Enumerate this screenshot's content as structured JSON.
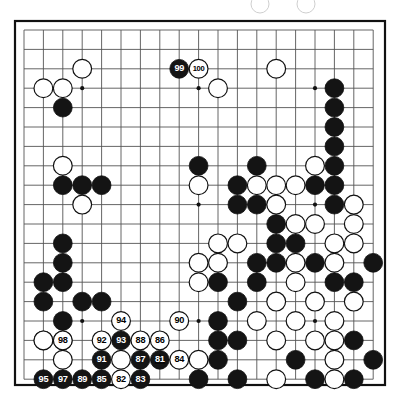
{
  "diagram": {
    "kind": "go-board-diagram",
    "board_size": 19,
    "visible_columns": 19,
    "visible_rows": 19,
    "colors": {
      "black_stone": "#141414",
      "white_stone": "#ffffff",
      "stone_outline": "#111111",
      "grid_line": "#555555",
      "border_line": "#111111",
      "background": "#ffffff",
      "label_on_black": "#ffffff",
      "label_on_white": "#000000"
    },
    "geometry": {
      "origin_x": 24,
      "origin_y": 30,
      "step": 19.4,
      "stone_radius": 9.4,
      "border_x": 15,
      "border_y": 21,
      "border_w": 370,
      "border_h": 364
    },
    "star_points": [
      {
        "col": 3,
        "row": 3
      },
      {
        "col": 9,
        "row": 3
      },
      {
        "col": 15,
        "row": 3
      },
      {
        "col": 3,
        "row": 9
      },
      {
        "col": 9,
        "row": 9
      },
      {
        "col": 15,
        "row": 9
      },
      {
        "col": 3,
        "row": 15
      },
      {
        "col": 9,
        "row": 15
      },
      {
        "col": 15,
        "row": 15
      }
    ],
    "ghost_circles": [
      {
        "cx": 260,
        "cy": 4,
        "r": 9
      },
      {
        "cx": 306,
        "cy": 4,
        "r": 9
      }
    ],
    "triangle_marks": [
      {
        "col": 7,
        "row": 17
      }
    ],
    "stones": [
      {
        "col": 3,
        "row": 2,
        "color": "white",
        "label": ""
      },
      {
        "col": 1,
        "row": 3,
        "color": "white",
        "label": ""
      },
      {
        "col": 2,
        "row": 3,
        "color": "white",
        "label": ""
      },
      {
        "col": 2,
        "row": 4,
        "color": "black",
        "label": ""
      },
      {
        "col": 2,
        "row": 7,
        "color": "white",
        "label": ""
      },
      {
        "col": 3,
        "row": 9,
        "color": "white",
        "label": ""
      },
      {
        "col": 2,
        "row": 8,
        "color": "black",
        "label": ""
      },
      {
        "col": 3,
        "row": 8,
        "color": "black",
        "label": ""
      },
      {
        "col": 4,
        "row": 8,
        "color": "black",
        "label": ""
      },
      {
        "col": 8,
        "row": 2,
        "color": "black",
        "label": "99"
      },
      {
        "col": 9,
        "row": 2,
        "color": "white",
        "label": "100"
      },
      {
        "col": 10,
        "row": 3,
        "color": "white",
        "label": ""
      },
      {
        "col": 13,
        "row": 2,
        "color": "white",
        "label": ""
      },
      {
        "col": 16,
        "row": 3,
        "color": "black",
        "label": ""
      },
      {
        "col": 16,
        "row": 4,
        "color": "black",
        "label": ""
      },
      {
        "col": 16,
        "row": 5,
        "color": "black",
        "label": ""
      },
      {
        "col": 16,
        "row": 6,
        "color": "black",
        "label": ""
      },
      {
        "col": 15,
        "row": 7,
        "color": "white",
        "label": ""
      },
      {
        "col": 16,
        "row": 7,
        "color": "black",
        "label": ""
      },
      {
        "col": 12,
        "row": 7,
        "color": "black",
        "label": ""
      },
      {
        "col": 11,
        "row": 8,
        "color": "black",
        "label": ""
      },
      {
        "col": 12,
        "row": 8,
        "color": "white",
        "label": ""
      },
      {
        "col": 13,
        "row": 8,
        "color": "white",
        "label": ""
      },
      {
        "col": 14,
        "row": 8,
        "color": "white",
        "label": ""
      },
      {
        "col": 15,
        "row": 8,
        "color": "black",
        "label": ""
      },
      {
        "col": 16,
        "row": 8,
        "color": "black",
        "label": ""
      },
      {
        "col": 11,
        "row": 9,
        "color": "black",
        "label": ""
      },
      {
        "col": 12,
        "row": 9,
        "color": "black",
        "label": ""
      },
      {
        "col": 13,
        "row": 9,
        "color": "white",
        "label": ""
      },
      {
        "col": 16,
        "row": 9,
        "color": "black",
        "label": ""
      },
      {
        "col": 17,
        "row": 9,
        "color": "white",
        "label": ""
      },
      {
        "col": 9,
        "row": 7,
        "color": "black",
        "label": ""
      },
      {
        "col": 9,
        "row": 8,
        "color": "white",
        "label": ""
      },
      {
        "col": 13,
        "row": 10,
        "color": "black",
        "label": ""
      },
      {
        "col": 14,
        "row": 10,
        "color": "white",
        "label": ""
      },
      {
        "col": 15,
        "row": 10,
        "color": "white",
        "label": ""
      },
      {
        "col": 17,
        "row": 10,
        "color": "white",
        "label": ""
      },
      {
        "col": 10,
        "row": 11,
        "color": "white",
        "label": ""
      },
      {
        "col": 11,
        "row": 11,
        "color": "white",
        "label": ""
      },
      {
        "col": 13,
        "row": 11,
        "color": "black",
        "label": ""
      },
      {
        "col": 14,
        "row": 11,
        "color": "black",
        "label": ""
      },
      {
        "col": 16,
        "row": 11,
        "color": "white",
        "label": ""
      },
      {
        "col": 17,
        "row": 11,
        "color": "white",
        "label": ""
      },
      {
        "col": 2,
        "row": 11,
        "color": "black",
        "label": ""
      },
      {
        "col": 2,
        "row": 12,
        "color": "black",
        "label": ""
      },
      {
        "col": 9,
        "row": 12,
        "color": "white",
        "label": ""
      },
      {
        "col": 10,
        "row": 12,
        "color": "white",
        "label": ""
      },
      {
        "col": 12,
        "row": 12,
        "color": "black",
        "label": ""
      },
      {
        "col": 13,
        "row": 12,
        "color": "black",
        "label": ""
      },
      {
        "col": 15,
        "row": 12,
        "color": "black",
        "label": ""
      },
      {
        "col": 16,
        "row": 12,
        "color": "white",
        "label": ""
      },
      {
        "col": 18,
        "row": 12,
        "color": "black",
        "label": ""
      },
      {
        "col": 1,
        "row": 13,
        "color": "black",
        "label": ""
      },
      {
        "col": 2,
        "row": 13,
        "color": "black",
        "label": ""
      },
      {
        "col": 9,
        "row": 13,
        "color": "white",
        "label": ""
      },
      {
        "col": 10,
        "row": 13,
        "color": "black",
        "label": ""
      },
      {
        "col": 12,
        "row": 13,
        "color": "black",
        "label": ""
      },
      {
        "col": 14,
        "row": 13,
        "color": "white",
        "label": ""
      },
      {
        "col": 16,
        "row": 13,
        "color": "black",
        "label": ""
      },
      {
        "col": 17,
        "row": 13,
        "color": "black",
        "label": ""
      },
      {
        "col": 1,
        "row": 14,
        "color": "black",
        "label": ""
      },
      {
        "col": 3,
        "row": 14,
        "color": "black",
        "label": ""
      },
      {
        "col": 4,
        "row": 14,
        "color": "black",
        "label": ""
      },
      {
        "col": 2,
        "row": 15,
        "color": "black",
        "label": ""
      },
      {
        "col": 1,
        "row": 16,
        "color": "black",
        "label": ""
      },
      {
        "col": 2,
        "row": 16,
        "color": "black",
        "label": ""
      },
      {
        "col": 5,
        "row": 15,
        "color": "white",
        "label": "94"
      },
      {
        "col": 8,
        "row": 15,
        "color": "white",
        "label": "90"
      },
      {
        "col": 1,
        "row": 16,
        "color": "white",
        "label": ""
      },
      {
        "col": 2,
        "row": 16,
        "color": "white",
        "label": "98"
      },
      {
        "col": 4,
        "row": 16,
        "color": "white",
        "label": "92"
      },
      {
        "col": 5,
        "row": 16,
        "color": "black",
        "label": "93"
      },
      {
        "col": 6,
        "row": 16,
        "color": "white",
        "label": "88"
      },
      {
        "col": 7,
        "row": 16,
        "color": "white",
        "label": "86"
      },
      {
        "col": 2,
        "row": 17,
        "color": "white",
        "label": ""
      },
      {
        "col": 4,
        "row": 17,
        "color": "black",
        "label": "91"
      },
      {
        "col": 5,
        "row": 17,
        "color": "white",
        "label": ""
      },
      {
        "col": 6,
        "row": 17,
        "color": "black",
        "label": "87"
      },
      {
        "col": 7,
        "row": 17,
        "color": "black",
        "label": "81"
      },
      {
        "col": 8,
        "row": 17,
        "color": "white",
        "label": "84"
      },
      {
        "col": 1,
        "row": 18,
        "color": "black",
        "label": "95"
      },
      {
        "col": 2,
        "row": 18,
        "color": "black",
        "label": "97"
      },
      {
        "col": 3,
        "row": 18,
        "color": "black",
        "label": "89"
      },
      {
        "col": 4,
        "row": 18,
        "color": "black",
        "label": "85"
      },
      {
        "col": 5,
        "row": 18,
        "color": "white",
        "label": "82"
      },
      {
        "col": 6,
        "row": 18,
        "color": "black",
        "label": "83"
      },
      {
        "col": 9,
        "row": 17,
        "color": "white",
        "label": ""
      },
      {
        "col": 11,
        "row": 14,
        "color": "black",
        "label": ""
      },
      {
        "col": 13,
        "row": 14,
        "color": "white",
        "label": ""
      },
      {
        "col": 10,
        "row": 15,
        "color": "black",
        "label": ""
      },
      {
        "col": 12,
        "row": 15,
        "color": "white",
        "label": ""
      },
      {
        "col": 14,
        "row": 15,
        "color": "white",
        "label": ""
      },
      {
        "col": 16,
        "row": 15,
        "color": "white",
        "label": ""
      },
      {
        "col": 10,
        "row": 16,
        "color": "black",
        "label": ""
      },
      {
        "col": 11,
        "row": 16,
        "color": "black",
        "label": ""
      },
      {
        "col": 13,
        "row": 16,
        "color": "white",
        "label": ""
      },
      {
        "col": 15,
        "row": 16,
        "color": "white",
        "label": ""
      },
      {
        "col": 16,
        "row": 16,
        "color": "white",
        "label": ""
      },
      {
        "col": 10,
        "row": 17,
        "color": "black",
        "label": ""
      },
      {
        "col": 14,
        "row": 17,
        "color": "black",
        "label": ""
      },
      {
        "col": 16,
        "row": 17,
        "color": "white",
        "label": ""
      },
      {
        "col": 18,
        "row": 17,
        "color": "black",
        "label": ""
      },
      {
        "col": 9,
        "row": 18,
        "color": "black",
        "label": ""
      },
      {
        "col": 11,
        "row": 18,
        "color": "black",
        "label": ""
      },
      {
        "col": 13,
        "row": 18,
        "color": "white",
        "label": ""
      },
      {
        "col": 15,
        "row": 18,
        "color": "black",
        "label": ""
      },
      {
        "col": 17,
        "row": 18,
        "color": "black",
        "label": ""
      },
      {
        "col": 14,
        "row": 12,
        "color": "white",
        "label": ""
      },
      {
        "col": 15,
        "row": 14,
        "color": "white",
        "label": ""
      },
      {
        "col": 17,
        "row": 14,
        "color": "white",
        "label": ""
      },
      {
        "col": 17,
        "row": 16,
        "color": "black",
        "label": ""
      },
      {
        "col": 16,
        "row": 18,
        "color": "white",
        "label": ""
      }
    ]
  }
}
